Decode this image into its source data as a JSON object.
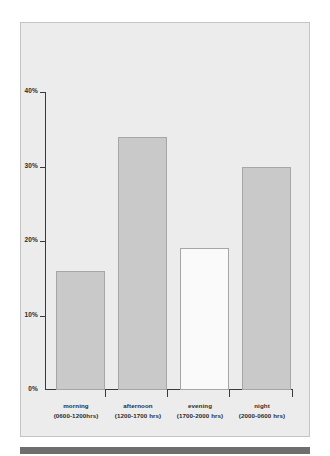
{
  "chart_data": {
    "type": "bar",
    "title": "",
    "subtitle": "",
    "xlabel": "",
    "ylabel": "",
    "categories": [
      "morning",
      "afternoon",
      "evening",
      "night"
    ],
    "category_sublabels": [
      "(0600-1200hrs)",
      "(1200-1700 hrs)",
      "(1700-2000 hrs)",
      "(2000-0600 hrs)"
    ],
    "values": [
      16,
      34,
      19,
      30
    ],
    "value_labels": [
      "16%",
      "34%",
      "19%",
      "30%"
    ],
    "ylim": [
      0,
      40
    ],
    "ytick_values": [
      0,
      10,
      20,
      30,
      40
    ],
    "ytick_labels": [
      "0%",
      "10%",
      "20%",
      "30%",
      "40%"
    ],
    "grid": false,
    "legend": null,
    "bar_styles": [
      "filled",
      "filled",
      "hollow",
      "filled"
    ],
    "colors": {
      "bar_fill": "#c9c9c9",
      "bar_hollow_fill": "#fafafa",
      "bar_border": "#a6a6a6",
      "axis": "#3a3a3a",
      "panel_background": "#ececec",
      "panel_border": "#c4c4c4",
      "text": "#2b2b2b",
      "bottom_rule": "#6e6e6e",
      "page_background": "#ffffff"
    }
  }
}
